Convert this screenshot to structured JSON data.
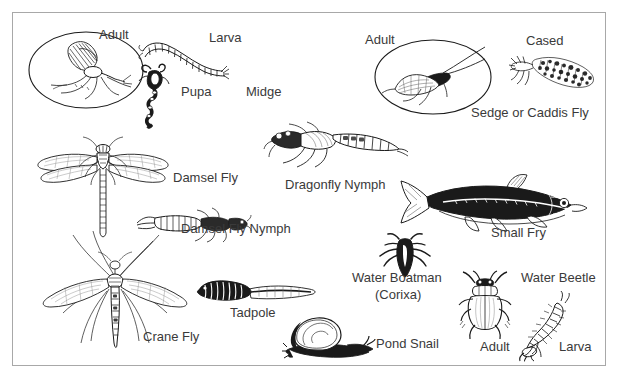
{
  "poster": {
    "title_visible": false,
    "background_color": "#ffffff",
    "border_color": "#a8a8a8",
    "ink_color": "#1a1a1a",
    "label_color": "#3a3a3a"
  },
  "groups": [
    {
      "name": "midge",
      "common_label": "Midge",
      "stages": [
        "Adult",
        "Larva",
        "Pupa"
      ]
    },
    {
      "name": "sedge-caddis-fly",
      "common_label": "Sedge or Caddis Fly",
      "stages": [
        "Adult",
        "Cased"
      ]
    },
    {
      "name": "damsel-fly",
      "common_label": "Damsel Fly",
      "stages": [
        "Damsel Fly Nymph"
      ]
    },
    {
      "name": "dragonfly",
      "common_label": "Dragonfly Nymph",
      "stages": []
    },
    {
      "name": "small-fry",
      "common_label": "Small Fry",
      "stages": []
    },
    {
      "name": "crane-fly",
      "common_label": "Crane Fly",
      "stages": []
    },
    {
      "name": "tadpole",
      "common_label": "Tadpole",
      "stages": []
    },
    {
      "name": "water-boatman",
      "common_label": "Water Boatman",
      "sub_label": "(Corixa)",
      "stages": []
    },
    {
      "name": "pond-snail",
      "common_label": "Pond Snail",
      "stages": []
    },
    {
      "name": "water-beetle",
      "common_label": "Water Beetle",
      "stages": [
        "Adult",
        "Larva"
      ]
    }
  ],
  "labels": {
    "midge_adult": "Adult",
    "midge_larva": "Larva",
    "midge_pupa": "Pupa",
    "midge_name": "Midge",
    "caddis_adult": "Adult",
    "caddis_cased": "Cased",
    "caddis_name": "Sedge or Caddis Fly",
    "damsel_fly": "Damsel Fly",
    "damsel_fly_nymph": "Damsel Fly Nymph",
    "dragonfly_nymph": "Dragonfly Nymph",
    "small_fry": "Small Fry",
    "crane_fly": "Crane Fly",
    "tadpole": "Tadpole",
    "water_boatman": "Water Boatman",
    "water_boatman_alt": "(Corixa)",
    "pond_snail": "Pond Snail",
    "water_beetle": "Water Beetle",
    "water_beetle_adult": "Adult",
    "water_beetle_larva": "Larva"
  },
  "figures": {
    "midge_adult": "midge-adult-in-ellipse-illustration",
    "midge_larva": "midge-larva-illustration",
    "midge_pupa": "midge-pupa-illustration",
    "caddis_adult": "caddis-fly-adult-in-ellipse-illustration",
    "caddis_cased": "cased-caddis-larva-illustration",
    "damsel_fly": "damsel-fly-adult-illustration",
    "damsel_fly_nymph": "damsel-fly-nymph-illustration",
    "dragonfly_nymph": "dragonfly-nymph-illustration",
    "small_fry": "small-fry-fish-illustration",
    "crane_fly": "crane-fly-illustration",
    "tadpole": "tadpole-illustration",
    "water_boatman": "water-boatman-illustration",
    "pond_snail": "pond-snail-illustration",
    "water_beetle_adult": "water-beetle-adult-illustration",
    "water_beetle_larva": "water-beetle-larva-illustration"
  }
}
